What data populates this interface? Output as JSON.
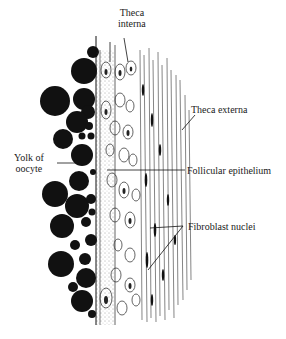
{
  "figure": {
    "colors": {
      "ink": "#111111",
      "background": "#ffffff",
      "stipple": "#555555"
    },
    "labels": {
      "theca_interna_line1": "Theca",
      "theca_interna_line2": "interna",
      "theca_externa": "Theca externa",
      "yolk_line1": "Yolk of",
      "yolk_line2": "oocyte",
      "follicular_epithelium": "Follicular epithelium",
      "fibroblast_nuclei": "Fibroblast nuclei"
    }
  }
}
